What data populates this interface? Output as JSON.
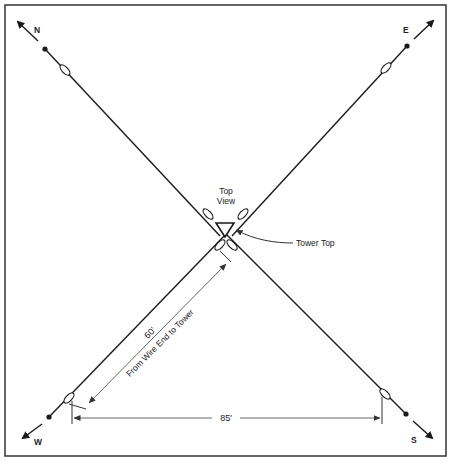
{
  "diagram": {
    "type": "antenna-layout-top-view",
    "labels": {
      "north": "N",
      "east": "E",
      "west": "W",
      "south": "S",
      "top_view_line1": "Top",
      "top_view_line2": "View",
      "tower_top": "Tower Top",
      "dim_60": "60'",
      "dim_60_caption": "From Wire End to Tower",
      "dim_85": "85'"
    },
    "colors": {
      "line": "#1a1a1a",
      "dim_line": "#555555",
      "border": "#333333",
      "background": "#ffffff"
    }
  }
}
